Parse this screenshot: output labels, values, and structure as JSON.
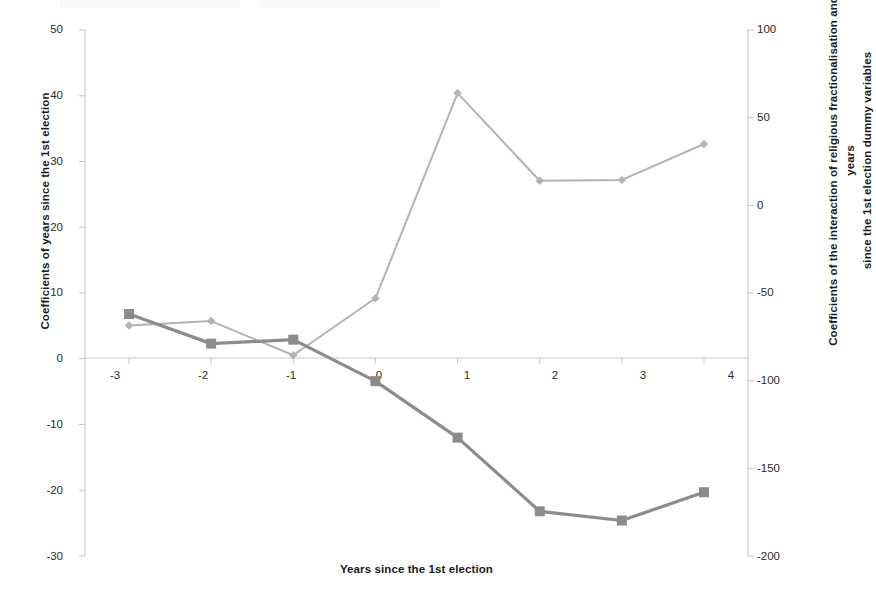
{
  "chart_data": {
    "type": "line",
    "title": "",
    "xlabel": "Years since the 1st election",
    "x": [
      -3,
      -2,
      -1,
      0,
      1,
      2,
      3,
      4
    ],
    "xtick_labels": [
      "-3",
      "-2",
      "-1",
      "0",
      "1",
      "2",
      "3",
      "4"
    ],
    "grid": false,
    "legend_position": "none",
    "axes": {
      "left": {
        "label": "Coefficients of years since the 1st election",
        "ylim": [
          -30,
          50
        ],
        "ticks": [
          50,
          40,
          30,
          20,
          10,
          0,
          -10,
          -20,
          -30
        ],
        "tick_labels": [
          "50",
          "40",
          "30",
          "20",
          "10",
          "0",
          "-10",
          "-20",
          "-30"
        ]
      },
      "right": {
        "label_line1": "Coefficients of the interaction of religious fractionalisation and the years",
        "label_line2": "since the 1st election dummy variables",
        "ylim": [
          -200,
          100
        ],
        "ticks": [
          100,
          50,
          0,
          -50,
          -100,
          -150,
          -200
        ],
        "tick_labels": [
          "100",
          "50",
          "0",
          "-50",
          "-100",
          "-150",
          "-200"
        ]
      }
    },
    "series": [
      {
        "name": "Coefficients of the interaction of religious fractionalisation and the years since the 1st election dummy variables",
        "axis": "right",
        "marker": "diamond",
        "color": "#b3b3b3",
        "values": [
          -68.5,
          -66.0,
          -85.5,
          -53.0,
          64.0,
          14.0,
          14.5,
          35.0
        ]
      },
      {
        "name": "Coefficients of years since the 1st election",
        "axis": "left",
        "marker": "square",
        "color": "#8c8c8c",
        "values": [
          6.8,
          2.3,
          2.9,
          -3.4,
          -12.0,
          -23.2,
          -24.6,
          -20.3
        ]
      }
    ]
  },
  "colors": {
    "series_light": "#b3b3b3",
    "series_dark": "#8c8c8c",
    "axis": "#bfbfbf",
    "text": "#1a1a1a"
  }
}
